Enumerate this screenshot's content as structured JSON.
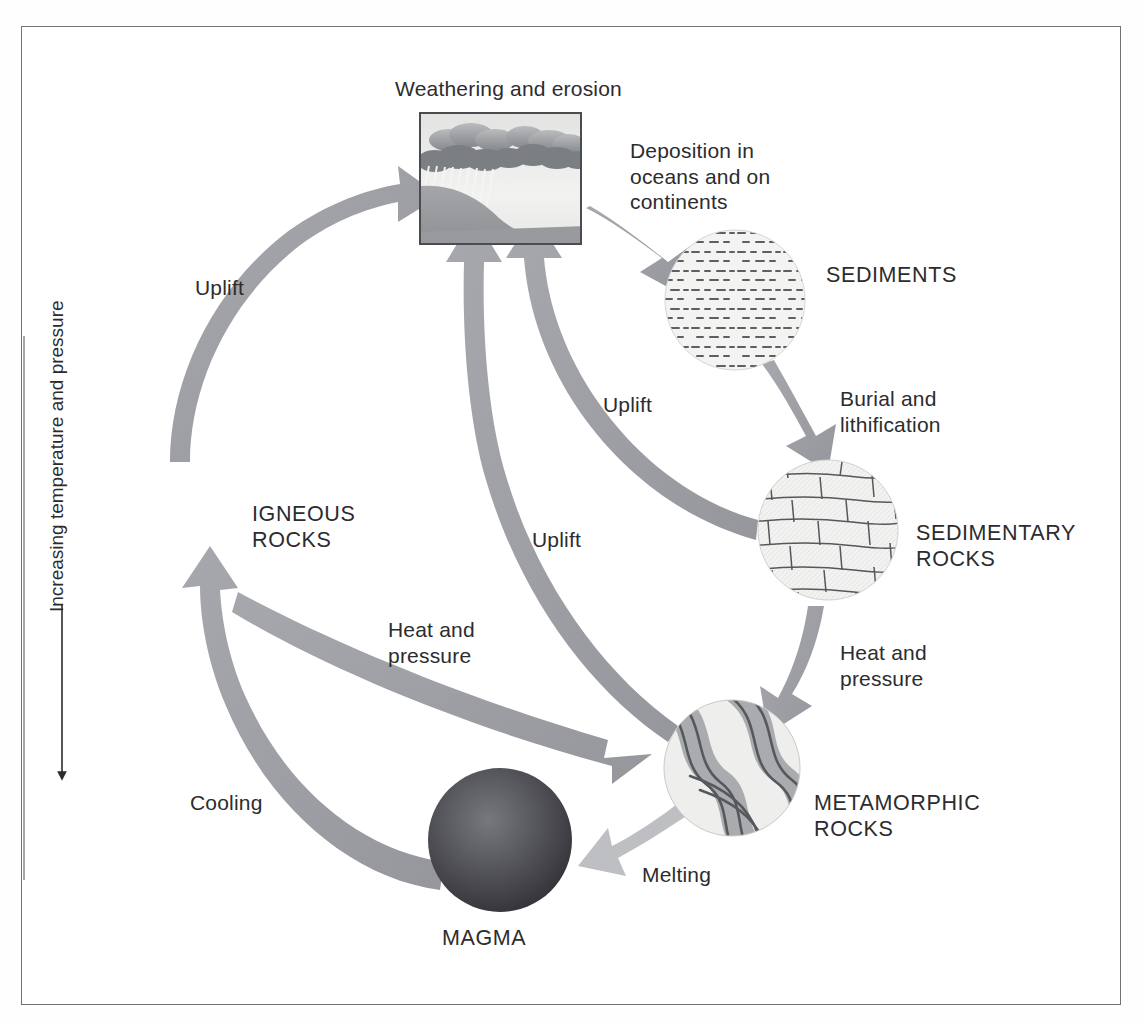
{
  "figure": {
    "border_color": "#6f7276",
    "background": "#ffffff"
  },
  "palette": {
    "arrow_gray": "#9a9ca1",
    "arrow_gray_light": "#b9bbbf",
    "text": "#2c2c2e",
    "circle_fill": "#f0f0ee",
    "circle_line": "#6e7176",
    "magma_dark": "#3a3a3c",
    "magma_mid": "#63636a"
  },
  "axis": {
    "label": "Increasing temperature and pressure",
    "direction": "down",
    "line_color": "#2c2c2e"
  },
  "nodes": [
    {
      "id": "weathering",
      "label": "Weathering and erosion",
      "shape": "box",
      "icon": "rain-cloud-hillside-icon",
      "cx": 500,
      "cy": 178,
      "label_x": 395,
      "label_y": 76
    },
    {
      "id": "sediments",
      "label": "SEDIMENTS",
      "shape": "circle",
      "icon": "dashed-bedding-icon",
      "cx": 735,
      "cy": 300,
      "r": 70,
      "label_x": 826,
      "label_y": 262
    },
    {
      "id": "sedimentary-rocks",
      "label": "SEDIMENTARY\nROCKS",
      "shape": "circle",
      "icon": "brick-strata-icon",
      "cx": 828,
      "cy": 530,
      "r": 70,
      "label_x": 916,
      "label_y": 520
    },
    {
      "id": "metamorphic-rocks",
      "label": "METAMORPHIC\nROCKS",
      "shape": "circle",
      "icon": "wavy-foliation-icon",
      "cx": 732,
      "cy": 768,
      "r": 68,
      "label_x": 814,
      "label_y": 790
    },
    {
      "id": "magma",
      "label": "MAGMA",
      "shape": "sphere",
      "icon": "molten-sphere-icon",
      "cx": 500,
      "cy": 840,
      "r": 72,
      "label_x": 442,
      "label_y": 925
    },
    {
      "id": "igneous-rocks",
      "label": "IGNEOUS\nROCKS",
      "shape": "text-only",
      "label_x": 252,
      "label_y": 501
    }
  ],
  "arrows": [
    {
      "id": "deposition",
      "label": "Deposition in\noceans and on\ncontinents",
      "from": "weathering",
      "to": "sediments",
      "label_x": 630,
      "label_y": 138
    },
    {
      "id": "burial",
      "label": "Burial and\nlithification",
      "from": "sediments",
      "to": "sedimentary-rocks",
      "label_x": 840,
      "label_y": 386
    },
    {
      "id": "heat-pressure-right",
      "label": "Heat and\npressure",
      "from": "sedimentary-rocks",
      "to": "metamorphic-rocks",
      "label_x": 840,
      "label_y": 640
    },
    {
      "id": "melting",
      "label": "Melting",
      "from": "metamorphic-rocks",
      "to": "magma",
      "label_x": 642,
      "label_y": 862
    },
    {
      "id": "cooling",
      "label": "Cooling",
      "from": "magma",
      "to": "igneous-rocks",
      "label_x": 190,
      "label_y": 790
    },
    {
      "id": "heat-pressure-left",
      "label": "Heat and\npressure",
      "from": "igneous-rocks",
      "to": "metamorphic-rocks",
      "label_x": 388,
      "label_y": 617
    },
    {
      "id": "uplift-igneous",
      "label": "Uplift",
      "from": "igneous-rocks",
      "to": "weathering",
      "label_x": 195,
      "label_y": 275
    },
    {
      "id": "uplift-sedimentary",
      "label": "Uplift",
      "from": "sedimentary-rocks",
      "to": "weathering",
      "label_x": 603,
      "label_y": 392
    },
    {
      "id": "uplift-metamorphic",
      "label": "Uplift",
      "from": "metamorphic-rocks",
      "to": "weathering",
      "label_x": 532,
      "label_y": 527
    }
  ]
}
